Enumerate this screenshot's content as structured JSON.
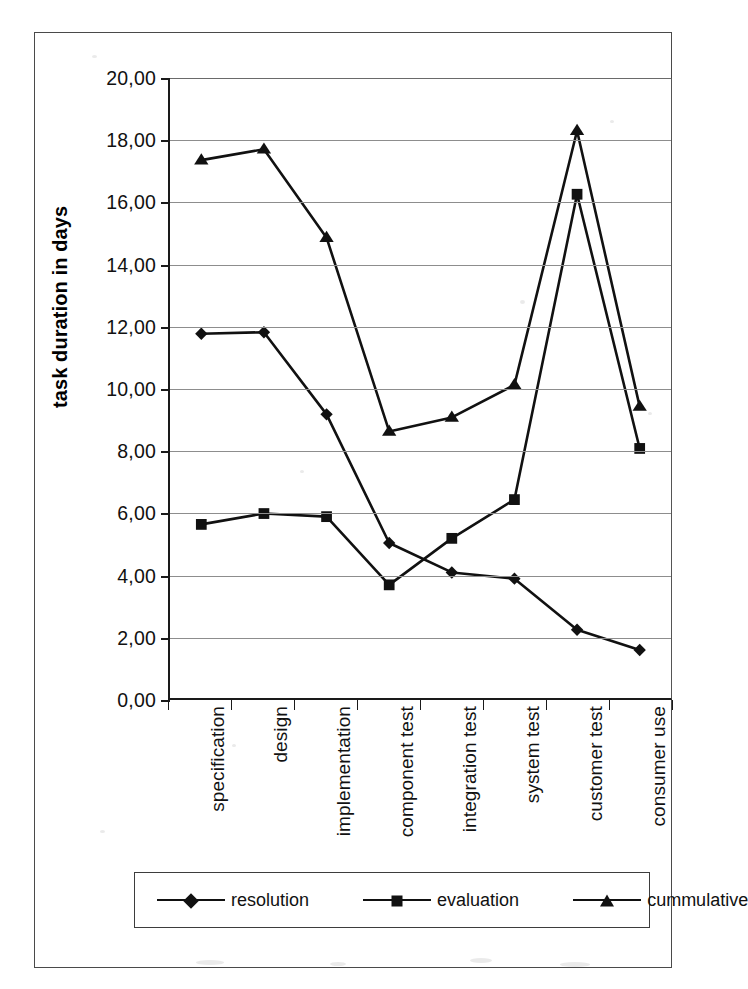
{
  "chart_data": {
    "type": "line",
    "title": "",
    "xlabel": "",
    "ylabel": "task duration in days",
    "ylim": [
      0,
      20
    ],
    "ytick_step": 2,
    "ytick_labels": [
      "0,00",
      "2,00",
      "4,00",
      "6,00",
      "8,00",
      "10,00",
      "12,00",
      "14,00",
      "16,00",
      "18,00",
      "20,00"
    ],
    "grid": true,
    "legend_position": "bottom",
    "categories": [
      "specification",
      "design",
      "implementation",
      "component test",
      "integration test",
      "system test",
      "customer test",
      "consumer use"
    ],
    "series": [
      {
        "name": "resolution",
        "marker": "diamond",
        "color": "#111111",
        "values": [
          11.75,
          11.8,
          9.15,
          5.0,
          4.05,
          3.85,
          2.2,
          1.55
        ]
      },
      {
        "name": "evaluation",
        "marker": "square",
        "color": "#111111",
        "values": [
          5.6,
          5.95,
          5.85,
          3.65,
          5.15,
          6.4,
          16.25,
          8.05
        ]
      },
      {
        "name": "cummulative",
        "marker": "triangle",
        "color": "#111111",
        "values": [
          17.35,
          17.7,
          14.85,
          8.6,
          9.05,
          10.1,
          18.3,
          9.4
        ]
      }
    ]
  },
  "axis": {
    "y_title": "task duration in days"
  },
  "legend": {
    "entries": [
      "resolution",
      "evaluation",
      "cummulative"
    ]
  }
}
